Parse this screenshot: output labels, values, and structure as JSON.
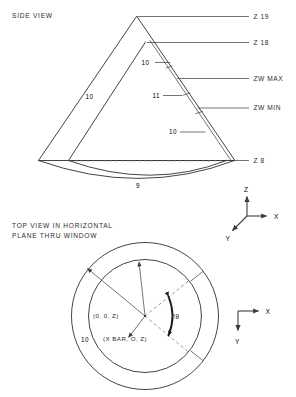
{
  "figure": {
    "side_view": {
      "title": "SIDE VIEW",
      "right_labels": [
        {
          "text": "Z 19"
        },
        {
          "text": "Z 18"
        },
        {
          "text": "ZW MAX"
        },
        {
          "text": "ZW MIN"
        },
        {
          "text": "Z 8"
        }
      ],
      "dimension_labels": [
        {
          "text": "10",
          "role": "left-wall"
        },
        {
          "text": "10",
          "role": "upper-right-segment"
        },
        {
          "text": "11",
          "role": "middle-right-segment"
        },
        {
          "text": "10",
          "role": "lower-right-segment"
        },
        {
          "text": "9",
          "role": "bottom-dish"
        }
      ],
      "axes": {
        "z": "Z",
        "x": "X",
        "y": "Y"
      }
    },
    "top_view": {
      "title_line1": "TOP VIEW IN HORIZONTAL",
      "title_line2": "PLANE THRU WINDOW",
      "center_label": "(0, 0, Z)",
      "offset_label": "(X BAR, O, Z)",
      "angle_label": "2θ",
      "radius_label": "10",
      "axes": {
        "x": "X",
        "y": "Y"
      }
    }
  },
  "colors": {
    "line": "#2f2f2f",
    "dashed": "#6d6d6d",
    "arc": "#1f1f1f",
    "text": "#2b2b2b",
    "background": "#ffffff"
  }
}
